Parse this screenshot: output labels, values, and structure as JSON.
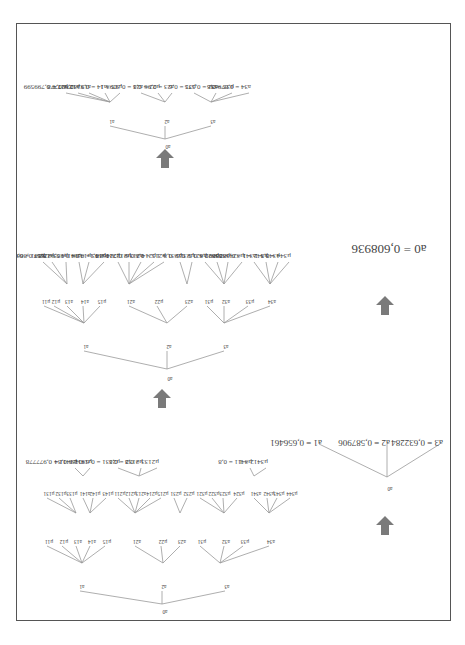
{
  "diagram": {
    "title": "",
    "stage1": {
      "root": "a0",
      "level1": [
        "a1",
        "a2",
        "a3"
      ],
      "level2": {
        "a1": [
          "μ11",
          "μ12",
          "a13",
          "a14",
          "μ15"
        ],
        "a2": [
          "a21",
          "μ22",
          "a23"
        ],
        "a3": [
          "μ31",
          "a32",
          "μ33",
          "a34"
        ]
      },
      "level3": {
        "a13": [
          "μ131",
          "μ132",
          "μ133"
        ],
        "a14": [
          "a141",
          "μ142",
          "μ143"
        ],
        "a21": [
          "μ211",
          "μ212",
          "a213",
          "μ214",
          "μ215"
        ],
        "a23": [
          "μ231",
          "μ232"
        ],
        "a32": [
          "μ321",
          "μ322",
          "μ323",
          "μ324"
        ],
        "a34": [
          "a341",
          "μ342",
          "μ343",
          "μ344"
        ]
      },
      "level4": [
        {
          "parent": "a141",
          "items": [
            {
              "label": "μ1411",
              "value": "0,977778"
            },
            {
              "label": "μ1412",
              "value": "0,84"
            }
          ]
        },
        {
          "parent": "a213",
          "items": [
            {
              "label": "μ2131",
              "value": "0,630435"
            },
            {
              "label": "μ2132",
              "value": "0,8"
            },
            {
              "label": "μ2133",
              "value": "0,8"
            }
          ]
        },
        {
          "parent": "a341",
          "items": [
            {
              "label": "μ3411",
              "value": "0,8"
            },
            {
              "label": "μ3412",
              "value": "1"
            }
          ]
        }
      ]
    },
    "stage2": {
      "root": "a0",
      "level1": [
        "a1",
        "a2",
        "a3"
      ],
      "level2": {
        "a1": [
          "μ11",
          "μ12",
          "a13",
          "a14",
          "μ15"
        ],
        "a2": [
          "a21",
          "μ22",
          "a23"
        ],
        "a3": [
          "μ31",
          "a32",
          "μ33",
          "a34"
        ]
      },
      "level3": [
        {
          "label": "μ131",
          "value": "0,6"
        },
        {
          "label": "μ132",
          "value": "0,866667"
        },
        {
          "label": "μ133",
          "value": "0,5"
        },
        {
          "label": "a141",
          "value": "0,922667"
        },
        {
          "label": "μ142",
          "value": "0,9"
        },
        {
          "label": "μ143",
          "value": "0,96"
        },
        {
          "label": "μ211",
          "value": "0,1"
        },
        {
          "label": "μ212",
          "value": "0,1"
        },
        {
          "label": "a213",
          "value": "0,724638"
        },
        {
          "label": "μ214",
          "value": "0,6"
        },
        {
          "label": "μ215",
          "value": "0,5"
        },
        {
          "label": "μ231",
          "value": "1"
        },
        {
          "label": "μ232",
          "value": "0,8"
        },
        {
          "label": "μ321",
          "value": "0,8"
        },
        {
          "label": "μ322",
          "value": "0,5"
        },
        {
          "label": "μ323",
          "value": "0,6"
        },
        {
          "label": "μ324",
          "value": "0,4"
        },
        {
          "label": "a341",
          "value": "0,888889"
        },
        {
          "label": "μ342",
          "value": "1"
        },
        {
          "label": "μ343",
          "value": "1"
        },
        {
          "label": "μ344",
          "value": "0,5"
        }
      ]
    },
    "stage3": {
      "root": "a0",
      "level1": [
        "a1",
        "a2",
        "a3"
      ],
      "level2": [
        {
          "label": "μ11",
          "value": "0,799599"
        },
        {
          "label": "μ12",
          "value": "0,4"
        },
        {
          "label": "a13",
          "value": "0,627778"
        },
        {
          "label": "a14",
          "value": "0,923273"
        },
        {
          "label": "μ15",
          "value": "1"
        },
        {
          "label": "a21",
          "value": "0,3093"
        },
        {
          "label": "μ22",
          "value": "0,8"
        },
        {
          "label": "a23",
          "value": "0,96"
        },
        {
          "label": "μ31",
          "value": "0,6"
        },
        {
          "label": "a32",
          "value": "0,575"
        },
        {
          "label": "μ33",
          "value": "0,6"
        },
        {
          "label": "a34",
          "value": "0,87963"
        }
      ]
    },
    "stage4": {
      "root": "a0",
      "level1": [
        {
          "label": "a1",
          "value": "0,656461"
        },
        {
          "label": "a2",
          "value": "0,587906"
        },
        {
          "label": "a3",
          "value": "0,632284"
        }
      ]
    },
    "result": {
      "label": "a0",
      "equals": "=",
      "value": "0,608936"
    },
    "arrow_color": "#7a7a7a",
    "border_color": "#555555"
  }
}
